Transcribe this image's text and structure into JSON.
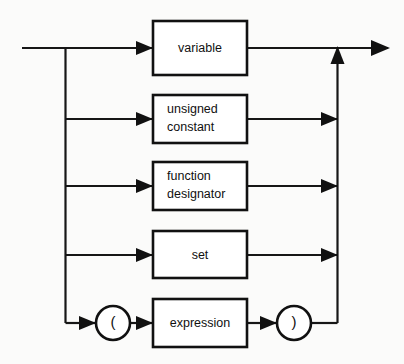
{
  "diagram": {
    "type": "railroad-syntax-diagram",
    "colors": {
      "line": "#161616",
      "box_fill": "#ffffff",
      "box_stroke": "#111111",
      "background": "#fbfbfa"
    },
    "alternatives": [
      {
        "id": "variable",
        "kind": "nonterminal-box",
        "label_lines": [
          "variable"
        ],
        "label_align": "center",
        "row_y": 48
      },
      {
        "id": "unsigned-constant",
        "kind": "nonterminal-box",
        "label_lines": [
          "unsigned",
          "constant"
        ],
        "label_align": "left",
        "row_y": 119
      },
      {
        "id": "function-designator",
        "kind": "nonterminal-box",
        "label_lines": [
          "function",
          "designator"
        ],
        "label_align": "left",
        "row_y": 186
      },
      {
        "id": "set",
        "kind": "nonterminal-box",
        "label_lines": [
          "set"
        ],
        "label_align": "center",
        "row_y": 255
      },
      {
        "id": "parenthesized-expression",
        "kind": "sequence",
        "label_lines": [
          "expression"
        ],
        "label_align": "center",
        "open_paren": "(",
        "close_paren": ")",
        "row_y": 323
      }
    ],
    "labels": {
      "variable": "variable",
      "unsigned": "unsigned",
      "constant": "constant",
      "function": "function",
      "designator": "designator",
      "set": "set",
      "expression": "expression",
      "open_paren": "(",
      "close_paren": ")"
    }
  }
}
